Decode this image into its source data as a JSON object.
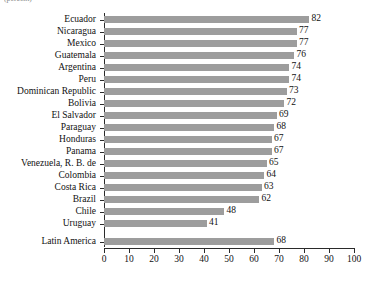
{
  "figure": {
    "unit_note": "(percent)"
  },
  "chart_data": {
    "type": "bar",
    "orientation": "horizontal",
    "title": "",
    "subtitle": "",
    "xlabel": "",
    "ylabel": "",
    "unit_note": "(percent)",
    "xlim": [
      0,
      100
    ],
    "xticks": [
      0,
      10,
      20,
      30,
      40,
      50,
      60,
      70,
      80,
      90,
      100
    ],
    "xticklabels": [
      "0",
      "10",
      "20",
      "30",
      "40",
      "50",
      "60",
      "70",
      "80",
      "90",
      "100"
    ],
    "grid": false,
    "legend": false,
    "bar_color": "#9d9d9d",
    "axis_color": "#2a2a2a",
    "categories": [
      "Ecuador",
      "Nicaragua",
      "Mexico",
      "Guatemala",
      "Argentina",
      "Peru",
      "Dominican Republic",
      "Bolivia",
      "El Salvador",
      "Paraguay",
      "Honduras",
      "Panama",
      "Venezuela, R. B. de",
      "Colombia",
      "Costa Rica",
      "Brazil",
      "Chile",
      "Uruguay",
      "Latin America"
    ],
    "values": [
      82,
      77,
      77,
      76,
      74,
      74,
      73,
      72,
      69,
      68,
      67,
      67,
      65,
      64,
      63,
      62,
      48,
      41,
      68
    ],
    "value_labels": [
      "82",
      "77",
      "77",
      "76",
      "74",
      "74",
      "73",
      "72",
      "69",
      "68",
      "67",
      "67",
      "65",
      "64",
      "63",
      "62",
      "48",
      "41",
      "68"
    ]
  }
}
